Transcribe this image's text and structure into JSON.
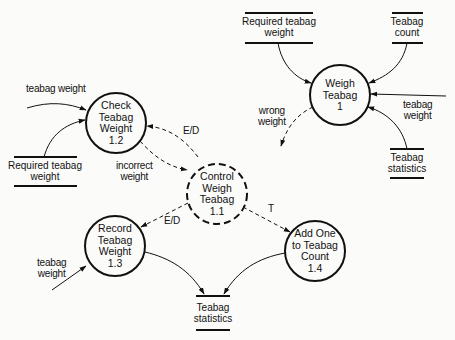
{
  "diagram": {
    "type": "data-flow-diagram",
    "processes": [
      {
        "id": "p1",
        "line1": "Weigh",
        "line2": "Teabag",
        "line3": "1",
        "line4": "",
        "style": "solid"
      },
      {
        "id": "p1_1",
        "line1": "Control",
        "line2": "Weigh",
        "line3": "Teabag",
        "line4": "1.1",
        "style": "dashed"
      },
      {
        "id": "p1_2",
        "line1": "Check",
        "line2": "Teabag",
        "line3": "Weight",
        "line4": "1.2",
        "style": "solid"
      },
      {
        "id": "p1_3",
        "line1": "Record",
        "line2": "Teabag",
        "line3": "Weight",
        "line4": "1.3",
        "style": "solid"
      },
      {
        "id": "p1_4",
        "line1": "Add One",
        "line2": "to Teabag",
        "line3": "Count",
        "line4": "1.4",
        "style": "solid"
      }
    ],
    "stores": [
      {
        "id": "s_req_top",
        "line1": "Required teabag",
        "line2": "weight"
      },
      {
        "id": "s_count",
        "line1": "Teabag",
        "line2": "count"
      },
      {
        "id": "s_stats_top",
        "line1": "Teabag",
        "line2": "statistics"
      },
      {
        "id": "s_req_left",
        "line1": "Required teabag",
        "line2": "weight"
      },
      {
        "id": "s_stats_bot",
        "line1": "Teabag",
        "line2": "statistics"
      }
    ],
    "flows": {
      "teabag_weight_p1": {
        "line1": "teabag",
        "line2": "weight"
      },
      "wrong_weight": {
        "line1": "wrong",
        "line2": "weight"
      },
      "teabag_weight_p12": {
        "line1": "teabag weight"
      },
      "incorrect_weight": {
        "line1": "incorrect",
        "line2": "weight"
      },
      "teabag_weight_p13": {
        "line1": "teabag",
        "line2": "weight"
      },
      "ed_to_p12": {
        "line1": "E/D"
      },
      "ed_to_p13": {
        "line1": "E/D"
      },
      "t_to_p14": {
        "line1": "T"
      }
    }
  }
}
